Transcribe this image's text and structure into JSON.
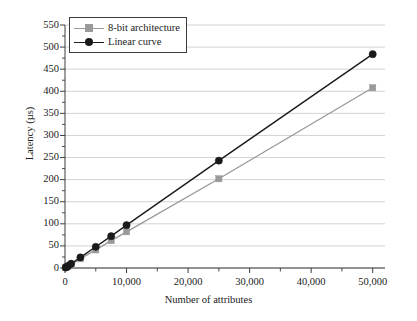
{
  "chart_data": {
    "type": "line",
    "title": "",
    "subtitle": "",
    "xlabel": "Number of attributes",
    "ylabel": "Latency (µs)",
    "xlim": [
      0,
      52000
    ],
    "ylim": [
      0,
      550
    ],
    "x_ticks": [
      0,
      10000,
      20000,
      30000,
      40000,
      50000
    ],
    "x_tick_labels": [
      "0",
      "10,000",
      "20,000",
      "30,000",
      "40,000",
      "50,000"
    ],
    "x_minor_step": 5000,
    "y_ticks": [
      0,
      50,
      100,
      150,
      200,
      250,
      300,
      350,
      400,
      450,
      500,
      550
    ],
    "y_tick_labels": [
      "0",
      "50",
      "100",
      "150",
      "200",
      "250",
      "300",
      "350",
      "400",
      "450",
      "500",
      "550"
    ],
    "grid": "horizontal",
    "grid_color": "#c8c8c8",
    "legend_position": "top-left",
    "x": [
      100,
      250,
      500,
      1000,
      2500,
      5000,
      7500,
      10000,
      25000,
      50000
    ],
    "series": [
      {
        "name": "8-bit architecture",
        "color": "#9a9a9a",
        "marker": "square",
        "values": [
          1,
          2,
          4,
          8,
          21,
          41,
          62,
          82,
          202,
          408
        ]
      },
      {
        "name": "Linear curve",
        "color": "#1a1a1a",
        "marker": "circle",
        "values": [
          1,
          2.4,
          4.8,
          9.7,
          24,
          48,
          72,
          97,
          243,
          484
        ]
      }
    ]
  },
  "legend": {
    "items": [
      {
        "label": "8-bit architecture",
        "color": "#9a9a9a",
        "marker": "square"
      },
      {
        "label": "Linear curve",
        "color": "#1a1a1a",
        "marker": "circle"
      }
    ]
  }
}
